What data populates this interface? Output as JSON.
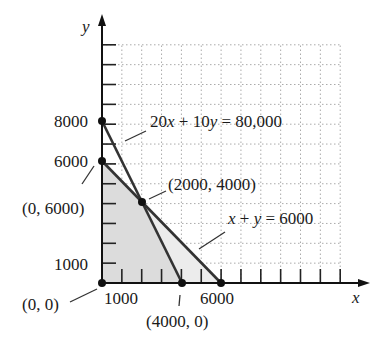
{
  "chart_data": {
    "type": "line",
    "title": "",
    "xlabel": "x",
    "ylabel": "y",
    "xlim": [
      0,
      12000
    ],
    "ylim": [
      0,
      12000
    ],
    "grid": true,
    "tick_step": 1000,
    "x_tick_labels": [
      "1000",
      "6000"
    ],
    "y_tick_labels": [
      "1000",
      "6000",
      "8000"
    ],
    "series": [
      {
        "name": "20x + 10y = 80,000",
        "points": [
          [
            0,
            8000
          ],
          [
            4000,
            0
          ]
        ]
      },
      {
        "name": "x + y = 6000",
        "points": [
          [
            0,
            6000
          ],
          [
            6000,
            0
          ]
        ]
      }
    ],
    "feasible_region": [
      [
        0,
        0
      ],
      [
        0,
        6000
      ],
      [
        2000,
        4000
      ],
      [
        4000,
        0
      ]
    ],
    "shaded_region_outer": [
      [
        0,
        0
      ],
      [
        0,
        6000
      ],
      [
        6000,
        0
      ]
    ],
    "points": [
      {
        "label": "(0, 0)",
        "x": 0,
        "y": 0
      },
      {
        "label": "(0, 6000)",
        "x": 0,
        "y": 6000
      },
      {
        "label": "(2000, 4000)",
        "x": 2000,
        "y": 4000
      },
      {
        "label": "(4000, 0)",
        "x": 4000,
        "y": 0
      },
      {
        "label": "",
        "x": 0,
        "y": 8000
      },
      {
        "label": "",
        "x": 6000,
        "y": 0
      }
    ],
    "annotations": [
      "20x + 10y = 80,000",
      "x + y = 6000"
    ]
  },
  "labels": {
    "y_axis": "y",
    "x_axis": "x",
    "y8000": "8000",
    "y6000": "6000",
    "y1000": "1000",
    "x1000": "1000",
    "x6000": "6000",
    "eq1": "20x + 10y = 80,000",
    "eq2": "x + y = 6000",
    "p_0_6000": "(0, 6000)",
    "p_2000_4000": "(2000, 4000)",
    "p_0_0": "(0, 0)",
    "p_4000_0": "(4000, 0)"
  }
}
